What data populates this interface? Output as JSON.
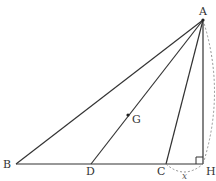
{
  "diagram": {
    "type": "geometry",
    "colors": {
      "line": "#333333",
      "dashed": "#888888",
      "background": "#ffffff"
    },
    "points": {
      "A": {
        "label": "A",
        "x": 203,
        "y": 20
      },
      "B": {
        "label": "B",
        "x": 16,
        "y": 164
      },
      "D": {
        "label": "D",
        "x": 91,
        "y": 164
      },
      "C": {
        "label": "C",
        "x": 166,
        "y": 164
      },
      "H": {
        "label": "H",
        "x": 203,
        "y": 164
      },
      "G": {
        "label": "G",
        "x": 128,
        "y": 115
      }
    },
    "segments": [
      "AB",
      "AD",
      "AC",
      "AH",
      "BH"
    ],
    "right_angle_at": "H",
    "dimension_label": "x",
    "dimension_between": [
      "C",
      "H"
    ]
  }
}
